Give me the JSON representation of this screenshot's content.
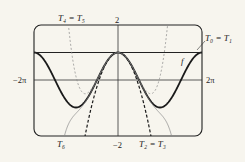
{
  "diagram": {
    "function_label": "f",
    "labels": {
      "t4_t5": "T₄ = T₅",
      "t0_t1": "T₀ = T₁",
      "t6": "T₆",
      "t2_t3": "T₂ = T₃"
    },
    "axis_ticks": {
      "y_max": "2",
      "y_min": "−2",
      "x_min": "−2π",
      "x_max": "2π"
    },
    "window": {
      "xmin": "-2π",
      "xmax": "2π",
      "ymin": -2,
      "ymax": 2
    },
    "curves": [
      {
        "name": "f",
        "expr": "cos x",
        "style": "solid-thick"
      },
      {
        "name": "T0 = T1",
        "expr": "1",
        "style": "solid"
      },
      {
        "name": "T2 = T3",
        "expr": "1 - x^2/2",
        "style": "dashed-thick"
      },
      {
        "name": "T4 = T5",
        "expr": "1 - x^2/2 + x^4/24",
        "style": "dashed-thin"
      },
      {
        "name": "T6",
        "expr": "1 - x^2/2 + x^4/24 - x^6/720",
        "style": "solid-thin"
      }
    ]
  }
}
